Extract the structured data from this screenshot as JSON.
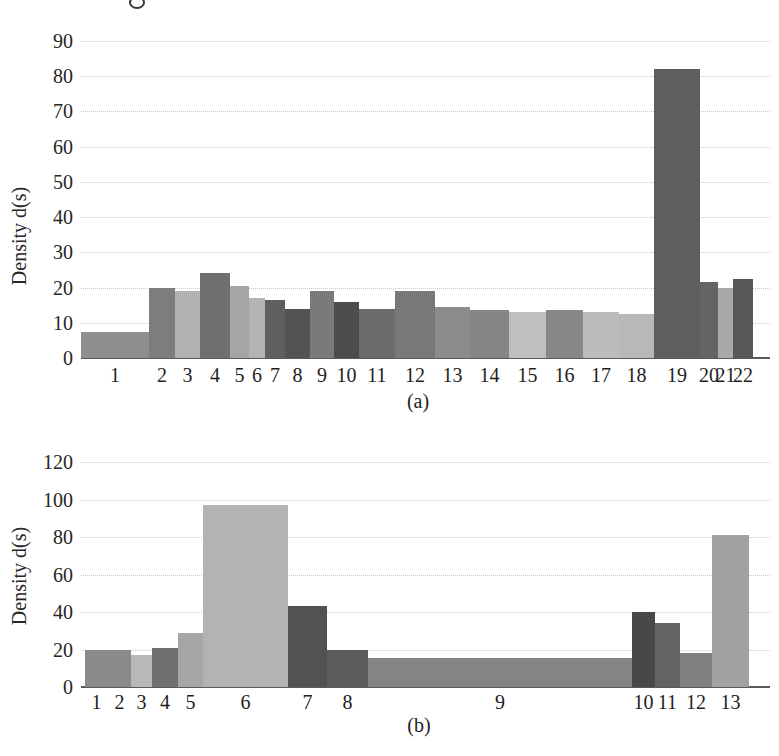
{
  "figure": {
    "captions": {
      "a": "(a)",
      "b": "(b)"
    },
    "y_axis_label": "Density d(s)"
  },
  "style": {
    "background": "#ffffff",
    "grid_color": "#c7c7c7",
    "axis_color": "#5a5a5a",
    "text_color": "#222222"
  },
  "chart_data": [
    {
      "id": "a",
      "type": "bar",
      "title": "",
      "xlabel": "",
      "ylabel": "Density d(s)",
      "caption": "(a)",
      "ylim": [
        0,
        90
      ],
      "yticks": [
        0,
        10,
        20,
        30,
        40,
        50,
        60,
        70,
        80,
        90
      ],
      "grid": "horizontal-dotted",
      "legend": "none",
      "categories": [
        "1",
        "2",
        "3",
        "4",
        "5",
        "6",
        "7",
        "8",
        "9",
        "10",
        "11",
        "12",
        "13",
        "14",
        "15",
        "16",
        "17",
        "18",
        "19",
        "20",
        "21",
        "22"
      ],
      "values": [
        7.5,
        20,
        19,
        24,
        20.5,
        17,
        16.5,
        14,
        19,
        16,
        14,
        19,
        14.5,
        13.5,
        13,
        13.5,
        13,
        12.5,
        82,
        21.5,
        20,
        22.5
      ],
      "bar_widths_px": [
        68,
        26,
        25,
        30,
        19,
        16,
        20,
        25,
        24,
        25,
        36,
        40,
        35,
        39,
        37,
        37,
        36,
        35,
        46,
        18,
        15,
        20
      ],
      "bar_colors": [
        "#8f8f8f",
        "#7d7d7d",
        "#b1b1b1",
        "#6f6f6f",
        "#a5a5a5",
        "#b3b3b3",
        "#5f5f5f",
        "#535353",
        "#7a7a7a",
        "#4c4c4c",
        "#6b6b6b",
        "#787878",
        "#8c8c8c",
        "#858585",
        "#bfbfbf",
        "#878787",
        "#bcbcbc",
        "#b8b8b8",
        "#5e5e5e",
        "#646464",
        "#a9a9a9",
        "#585858"
      ],
      "bar_inset_px": 0
    },
    {
      "id": "b",
      "type": "bar",
      "title": "",
      "xlabel": "",
      "ylabel": "Density d(s)",
      "caption": "(b)",
      "ylim": [
        0,
        120
      ],
      "yticks": [
        0,
        20,
        40,
        60,
        80,
        100,
        120
      ],
      "grid": "horizontal-dotted",
      "legend": "none",
      "categories": [
        "1",
        "2",
        "3",
        "4",
        "5",
        "6",
        "7",
        "8",
        "9",
        "10",
        "11",
        "12",
        "13"
      ],
      "values": [
        20,
        20,
        17,
        21,
        29,
        97,
        43,
        20,
        15.5,
        40,
        34,
        18,
        81
      ],
      "bar_widths_px": [
        23,
        23,
        21,
        26,
        25,
        85,
        39,
        41,
        264,
        23,
        25,
        32,
        37
      ],
      "bar_colors": [
        "#8a8a8a",
        "#8a8a8a",
        "#b8b8b8",
        "#707070",
        "#a6a6a6",
        "#b3b3b3",
        "#525252",
        "#5c5c5c",
        "#848484",
        "#484848",
        "#636363",
        "#7f7f7f",
        "#a2a2a2"
      ],
      "bar_inset_px": 4
    }
  ]
}
